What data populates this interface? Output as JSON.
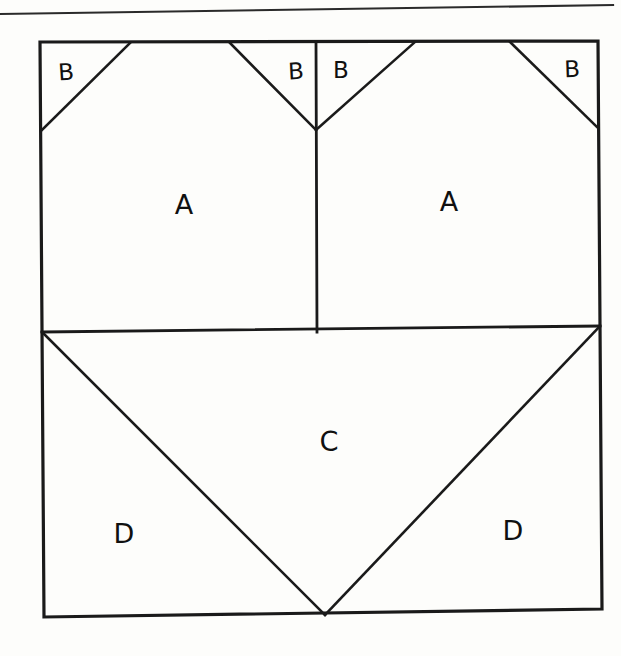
{
  "figure": {
    "background_color": "#fdfdfb",
    "ink_color": "#1a1a1a",
    "top_rule": {
      "name": "horizontal-rule",
      "x1": 0,
      "y1": 14,
      "x2": 613,
      "y2": 5
    },
    "outer_square": {
      "name": "outer-square",
      "top_left": [
        40,
        42
      ],
      "top_right": [
        598,
        41
      ],
      "bottom_right": [
        602,
        609
      ],
      "bottom_left": [
        44,
        617
      ]
    },
    "dividers": [
      {
        "name": "horizontal-divider",
        "x1": 42,
        "y1": 332,
        "x2": 600,
        "y2": 326
      },
      {
        "name": "vertical-divider",
        "x1": 316,
        "y1": 42,
        "x2": 317,
        "y2": 332
      }
    ],
    "diagonals": [
      {
        "name": "b1-diagonal",
        "x1": 41,
        "y1": 131,
        "x2": 130,
        "y2": 43
      },
      {
        "name": "b2-diagonal",
        "x1": 230,
        "y1": 43,
        "x2": 316,
        "y2": 130
      },
      {
        "name": "b3-diagonal",
        "x1": 316,
        "y1": 130,
        "x2": 415,
        "y2": 42
      },
      {
        "name": "b4-diagonal",
        "x1": 510,
        "y1": 42,
        "x2": 598,
        "y2": 128
      },
      {
        "name": "c-left-diagonal",
        "x1": 42,
        "y1": 332,
        "x2": 325,
        "y2": 615
      },
      {
        "name": "c-right-diagonal",
        "x1": 325,
        "y1": 615,
        "x2": 600,
        "y2": 326
      }
    ],
    "labels": [
      {
        "name": "label-b-top-left",
        "text": "B",
        "x": 66,
        "y": 72,
        "size": "small",
        "tilt": "b1"
      },
      {
        "name": "label-b-top-midleft",
        "text": "B",
        "x": 296,
        "y": 71,
        "size": "small",
        "tilt": "b2"
      },
      {
        "name": "label-b-top-midright",
        "text": "B",
        "x": 341,
        "y": 70,
        "size": "small",
        "tilt": "none"
      },
      {
        "name": "label-b-top-right",
        "text": "B",
        "x": 572,
        "y": 69,
        "size": "small",
        "tilt": "b4"
      },
      {
        "name": "label-a-left",
        "text": "A",
        "x": 184,
        "y": 204,
        "size": "big",
        "tilt": "none"
      },
      {
        "name": "label-a-right",
        "text": "A",
        "x": 449,
        "y": 201,
        "size": "big",
        "tilt": "none"
      },
      {
        "name": "label-c-center",
        "text": "C",
        "x": 329,
        "y": 441,
        "size": "big",
        "tilt": "c"
      },
      {
        "name": "label-d-left",
        "text": "D",
        "x": 124,
        "y": 533,
        "size": "big",
        "tilt": "none"
      },
      {
        "name": "label-d-right",
        "text": "D",
        "x": 513,
        "y": 530,
        "size": "big",
        "tilt": "none"
      }
    ]
  }
}
